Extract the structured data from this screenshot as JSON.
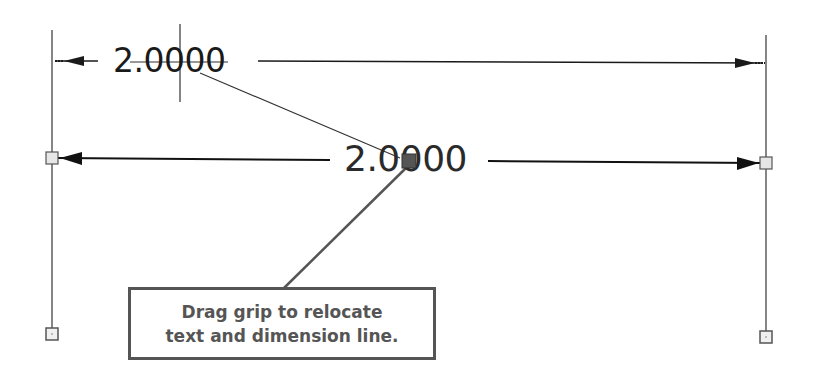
{
  "diagram": {
    "type": "cad-linear-dimension-grip-edit",
    "colors": {
      "line": "#1a1a1a",
      "extension_line": "#444444",
      "grip_fill": "#e6e6e6",
      "grip_border": "#555555",
      "active_grip": "#555555",
      "callout_border": "#555555",
      "callout_text": "#555555"
    },
    "original_dimension": {
      "text": "2.0000"
    },
    "relocated_dimension": {
      "text": "2.0000"
    },
    "callout": {
      "line1": "Drag grip to relocate",
      "line2": "text and dimension line."
    },
    "grips": [
      {
        "name": "left-dimension-line-grip"
      },
      {
        "name": "right-dimension-line-grip"
      },
      {
        "name": "left-extension-origin-grip"
      },
      {
        "name": "right-extension-origin-grip"
      },
      {
        "name": "text-grip-active"
      }
    ]
  }
}
